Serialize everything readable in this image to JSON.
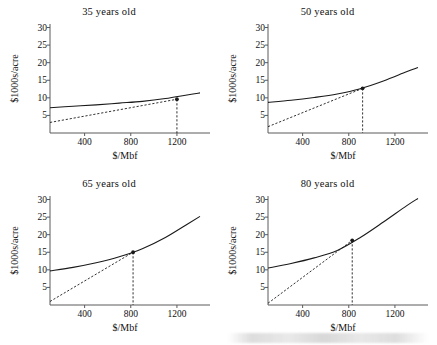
{
  "figure": {
    "panel_order": [
      "p35",
      "p50",
      "p65",
      "p80"
    ],
    "xlabel": "$/Mbf",
    "ylabel": "$1000s/acre"
  },
  "chart_data": [
    {
      "type": "line",
      "title": "35 years old",
      "xlabel": "$/Mbf",
      "ylabel": "$1000s/acre",
      "xlim": [
        100,
        1400
      ],
      "ylim": [
        0,
        31
      ],
      "xticks": [
        400,
        800,
        1200
      ],
      "yticks": [
        5,
        10,
        15,
        20,
        25,
        30
      ],
      "grid": false,
      "legend": "none",
      "series": [
        {
          "name": "value curve",
          "style": "solid",
          "x": [
            100,
            300,
            500,
            700,
            900,
            1100,
            1300,
            1400
          ],
          "values": [
            7.2,
            7.6,
            8.0,
            8.5,
            9.0,
            9.8,
            10.9,
            11.4
          ]
        },
        {
          "name": "tangent ray",
          "style": "dashed",
          "x": [
            100,
            1200
          ],
          "values": [
            3.0,
            9.6
          ]
        }
      ],
      "annotations": [
        {
          "name": "tangency-point",
          "x": 1200,
          "y": 9.6,
          "dropline": true
        }
      ]
    },
    {
      "type": "line",
      "title": "50 years old",
      "xlabel": "$/Mbf",
      "ylabel": "$1000s/acre",
      "xlim": [
        100,
        1400
      ],
      "ylim": [
        0,
        31
      ],
      "xticks": [
        400,
        800,
        1200
      ],
      "yticks": [
        5,
        10,
        15,
        20,
        25,
        30
      ],
      "grid": false,
      "legend": "none",
      "series": [
        {
          "name": "value curve",
          "style": "solid",
          "x": [
            100,
            300,
            500,
            700,
            900,
            1100,
            1300,
            1400
          ],
          "values": [
            8.7,
            9.3,
            10.1,
            11.1,
            12.6,
            14.8,
            17.4,
            18.6
          ]
        },
        {
          "name": "tangent ray",
          "style": "dashed",
          "x": [
            100,
            920
          ],
          "values": [
            1.8,
            12.7
          ]
        }
      ],
      "annotations": [
        {
          "name": "tangency-point",
          "x": 920,
          "y": 12.7,
          "dropline": true
        }
      ]
    },
    {
      "type": "line",
      "title": "65 years old",
      "xlabel": "$/Mbf",
      "ylabel": "$1000s/acre",
      "xlim": [
        100,
        1400
      ],
      "ylim": [
        0,
        31
      ],
      "xticks": [
        400,
        800,
        1200
      ],
      "yticks": [
        5,
        10,
        15,
        20,
        25,
        30
      ],
      "grid": false,
      "legend": "none",
      "series": [
        {
          "name": "value curve",
          "style": "solid",
          "x": [
            100,
            300,
            500,
            700,
            900,
            1100,
            1300,
            1400
          ],
          "values": [
            9.7,
            10.7,
            12.0,
            13.7,
            16.0,
            19.2,
            23.2,
            25.2
          ]
        },
        {
          "name": "tangent ray",
          "style": "dashed",
          "x": [
            100,
            820
          ],
          "values": [
            1.0,
            15.0
          ]
        }
      ],
      "annotations": [
        {
          "name": "tangency-point",
          "x": 820,
          "y": 15.0,
          "dropline": true
        }
      ]
    },
    {
      "type": "line",
      "title": "80 years old",
      "xlabel": "$/Mbf",
      "ylabel": "$1000s/acre",
      "xlim": [
        100,
        1400
      ],
      "ylim": [
        0,
        31
      ],
      "xticks": [
        400,
        800,
        1200
      ],
      "yticks": [
        5,
        10,
        15,
        20,
        25,
        30
      ],
      "grid": false,
      "legend": "none",
      "series": [
        {
          "name": "value curve",
          "style": "solid",
          "x": [
            100,
            300,
            500,
            700,
            900,
            1100,
            1300,
            1400
          ],
          "values": [
            10.5,
            11.8,
            13.4,
            15.5,
            19.2,
            23.6,
            28.2,
            30.3
          ]
        },
        {
          "name": "tangent ray",
          "style": "dashed",
          "x": [
            100,
            830
          ],
          "values": [
            0.5,
            18.4
          ]
        }
      ],
      "annotations": [
        {
          "name": "tangency-point",
          "x": 830,
          "y": 18.4,
          "dropline": true
        }
      ]
    }
  ],
  "colors": {
    "curve": "#1a1a1a",
    "axis": "#5a5a5a",
    "text": "#111111"
  }
}
